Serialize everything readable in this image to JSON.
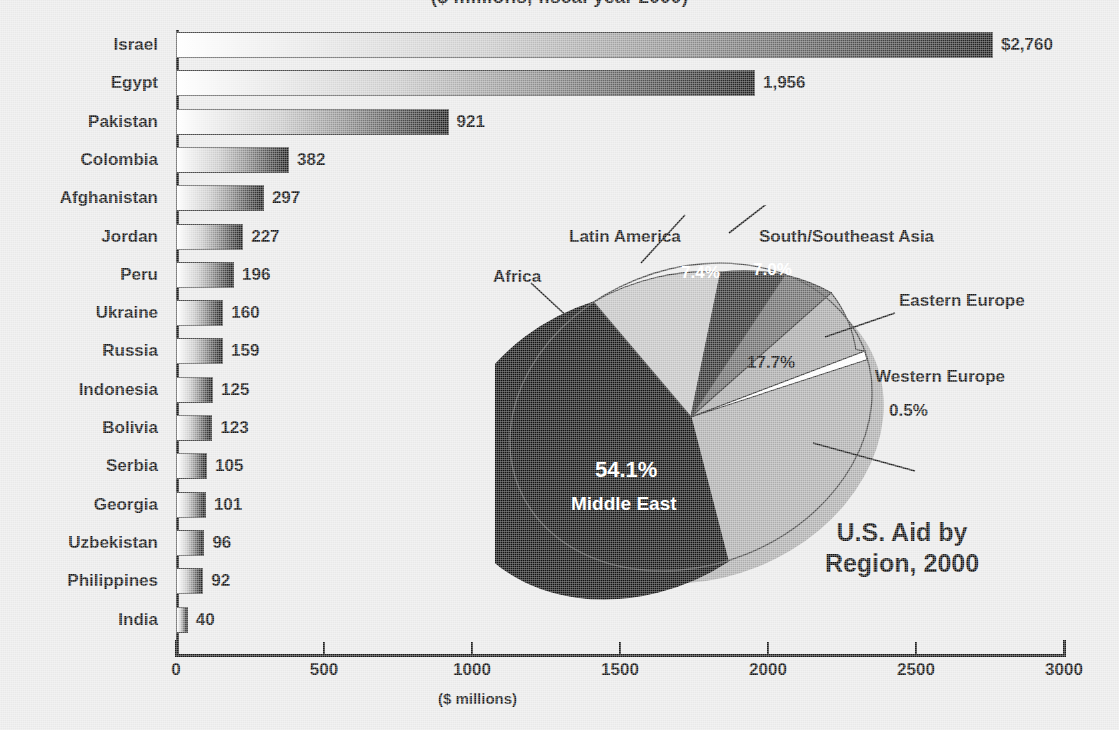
{
  "title_fragment": "($ millions, fiscal year 2000)",
  "chart_data": [
    {
      "type": "bar",
      "orientation": "horizontal",
      "title": "Top Recipients of U.S. Aid",
      "xlabel": "($ millions)",
      "ylabel": "",
      "xlim": [
        0,
        3000
      ],
      "xticks": [
        "0",
        "500",
        "1000",
        "1500",
        "2000",
        "2500",
        "3000"
      ],
      "xtick_values": [
        0,
        500,
        1000,
        1500,
        2000,
        2500,
        3000
      ],
      "grid": false,
      "categories": [
        "Israel",
        "Egypt",
        "Pakistan",
        "Colombia",
        "Afghanistan",
        "Jordan",
        "Peru",
        "Ukraine",
        "Russia",
        "Indonesia",
        "Bolivia",
        "Serbia",
        "Georgia",
        "Uzbekistan",
        "Philippines",
        "India"
      ],
      "values": [
        2760,
        1956,
        921,
        382,
        297,
        227,
        196,
        160,
        159,
        125,
        123,
        105,
        101,
        96,
        92,
        40
      ],
      "value_labels": [
        "$2,760",
        "1,956",
        "921",
        "382",
        "297",
        "227",
        "196",
        "160",
        "159",
        "125",
        "123",
        "105",
        "101",
        "96",
        "92",
        "40"
      ]
    },
    {
      "type": "pie",
      "title_line1": "U.S. Aid by",
      "title_line2": "Region, 2000",
      "labels": [
        "Middle East",
        "Eastern Europe",
        "Africa",
        "Latin America",
        "South/Southeast Asia",
        "Western Europe"
      ],
      "values": [
        54.1,
        17.7,
        13.3,
        7.4,
        7.0,
        0.5
      ],
      "value_labels": [
        "54.1%",
        "17.7%",
        "13.3%",
        "7.4%",
        "7.0%",
        "0.5%"
      ],
      "colors": [
        "#111111",
        "#a8a8a8",
        "#c2c2c2",
        "#2e2e2e",
        "#6b6b6b",
        "#fbfbfb"
      ],
      "legend_position": "callouts",
      "callouts": [
        {
          "label": "Africa",
          "value": "13.3%"
        },
        {
          "label": "Latin America",
          "value": "7.4%"
        },
        {
          "label": "South/Southeast Asia",
          "value": "7.0%"
        },
        {
          "label": "Eastern Europe",
          "value": "17.7%"
        },
        {
          "label": "Western Europe",
          "value": "0.5%"
        },
        {
          "label": "Middle East",
          "value": "54.1%"
        }
      ]
    }
  ],
  "bars": [
    {
      "label": "Israel",
      "value": 2760,
      "value_label": "$2,760"
    },
    {
      "label": "Egypt",
      "value": 1956,
      "value_label": "1,956"
    },
    {
      "label": "Pakistan",
      "value": 921,
      "value_label": "921"
    },
    {
      "label": "Colombia",
      "value": 382,
      "value_label": "382"
    },
    {
      "label": "Afghanistan",
      "value": 297,
      "value_label": "297"
    },
    {
      "label": "Jordan",
      "value": 227,
      "value_label": "227"
    },
    {
      "label": "Peru",
      "value": 196,
      "value_label": "196"
    },
    {
      "label": "Ukraine",
      "value": 160,
      "value_label": "160"
    },
    {
      "label": "Russia",
      "value": 159,
      "value_label": "159"
    },
    {
      "label": "Indonesia",
      "value": 125,
      "value_label": "125"
    },
    {
      "label": "Bolivia",
      "value": 123,
      "value_label": "123"
    },
    {
      "label": "Serbia",
      "value": 105,
      "value_label": "105"
    },
    {
      "label": "Georgia",
      "value": 101,
      "value_label": "101"
    },
    {
      "label": "Uzbekistan",
      "value": 96,
      "value_label": "96"
    },
    {
      "label": "Philippines",
      "value": 92,
      "value_label": "92"
    },
    {
      "label": "India",
      "value": 40,
      "value_label": "40"
    }
  ],
  "axis": {
    "ticks": [
      "0",
      "500",
      "1000",
      "1500",
      "2000",
      "2500",
      "3000"
    ],
    "caption": "($ millions)"
  },
  "pie": {
    "title_line1": "U.S. Aid by",
    "title_line2": "Region, 2000",
    "slices": [
      {
        "name": "Middle East",
        "pct": "54.1%"
      },
      {
        "name": "Eastern Europe",
        "pct": "17.7%"
      },
      {
        "name": "Africa",
        "pct": "13.3%"
      },
      {
        "name": "Latin America",
        "pct": "7.4%"
      },
      {
        "name": "South/Southeast Asia",
        "pct": "7.0%"
      },
      {
        "name": "Western Europe",
        "pct": "0.5%"
      }
    ],
    "label_africa": "Africa",
    "label_latin": "Latin America",
    "label_sea": "South/Southeast Asia",
    "label_ee": "Eastern Europe",
    "label_we": "Western Europe",
    "label_me": "Middle East",
    "pct_africa": "13.3%",
    "pct_latin": "7.4%",
    "pct_sea": "7.0%",
    "pct_ee": "17.7%",
    "pct_we": "0.5%",
    "pct_me": "54.1%"
  }
}
